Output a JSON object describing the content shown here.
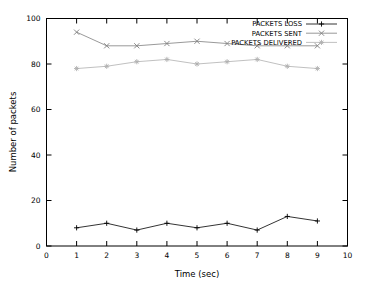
{
  "chart_data": {
    "type": "line",
    "title": "",
    "xlabel": "Time (sec)",
    "ylabel": "Number of packets",
    "xlim": [
      0,
      10
    ],
    "ylim": [
      0,
      100
    ],
    "xticks": [
      0,
      1,
      2,
      3,
      4,
      5,
      6,
      7,
      8,
      9,
      10
    ],
    "yticks": [
      0,
      20,
      40,
      60,
      80,
      100
    ],
    "grid": false,
    "legend_position": "top-right",
    "x": [
      1,
      2,
      3,
      4,
      5,
      6,
      7,
      8,
      9
    ],
    "series": [
      {
        "name": "PACKETS LOSS",
        "marker": "plus",
        "color": "#000000",
        "values": [
          8,
          10,
          7,
          10,
          8,
          10,
          7,
          13,
          11
        ]
      },
      {
        "name": "PACKETS SENT",
        "marker": "cross",
        "color": "#7f7f7f",
        "values": [
          94,
          88,
          88,
          89,
          90,
          89,
          88,
          88,
          88
        ]
      },
      {
        "name": "PACKETS DELIVERED",
        "marker": "star",
        "color": "#b0b0b0",
        "values": [
          78,
          79,
          81,
          82,
          80,
          81,
          82,
          79,
          78
        ]
      }
    ]
  },
  "axis": {
    "xlabel": "Time (sec)",
    "ylabel": "Number of packets",
    "xticks": [
      "0",
      "1",
      "2",
      "3",
      "4",
      "5",
      "6",
      "7",
      "8",
      "9",
      "10"
    ],
    "yticks": [
      "0",
      "20",
      "40",
      "60",
      "80",
      "100"
    ]
  },
  "legend": {
    "items": [
      {
        "label": "PACKETS LOSS"
      },
      {
        "label": "PACKETS SENT"
      },
      {
        "label": "PACKETS DELIVERED"
      }
    ]
  }
}
